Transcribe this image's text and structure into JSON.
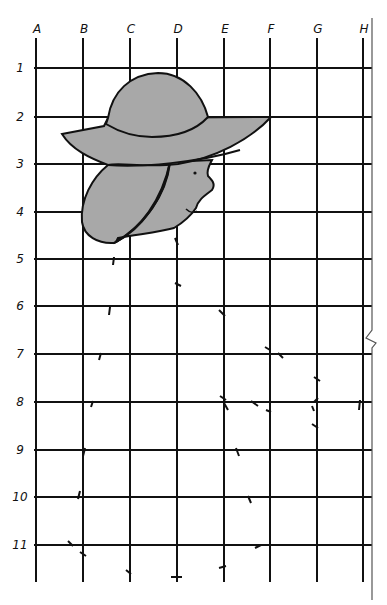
{
  "diagram": {
    "columns": [
      "A",
      "B",
      "C",
      "D",
      "E",
      "F",
      "G",
      "H"
    ],
    "rows": [
      "1",
      "2",
      "3",
      "4",
      "5",
      "6",
      "7",
      "8",
      "9",
      "10",
      "11"
    ],
    "column_x": [
      36,
      83,
      130,
      177,
      224,
      270,
      317,
      363
    ],
    "row_y": [
      68,
      117,
      164,
      212,
      259,
      306,
      354,
      402,
      450,
      497,
      545
    ],
    "colors": {
      "line": "#111111",
      "fill": "#a8a8a8",
      "background": "#ffffff"
    },
    "figure": {
      "elements": [
        "hat-crown",
        "hat-brim",
        "hair",
        "face-profile",
        "eye"
      ]
    }
  }
}
